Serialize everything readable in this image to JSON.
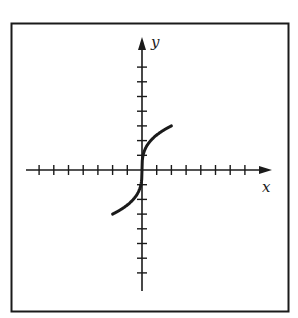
{
  "chart_data": {
    "type": "line",
    "title": "",
    "xlabel": "x",
    "ylabel": "y",
    "xlim": [
      -8,
      8
    ],
    "ylim": [
      -8,
      8
    ],
    "grid": false,
    "ticks": {
      "x": [
        -7,
        -6,
        -5,
        -4,
        -3,
        -2,
        -1,
        1,
        2,
        3,
        4,
        5,
        6,
        7
      ],
      "y": [
        -7,
        -6,
        -5,
        -4,
        -3,
        -2,
        -1,
        1,
        2,
        3,
        4,
        5,
        6,
        7
      ]
    },
    "tick_labels_shown": false,
    "series": [
      {
        "name": "curve",
        "description": "cube-root shaped curve through origin, vertical tangent at origin",
        "x": [
          -2,
          -1.5,
          -1,
          -0.5,
          -0.2,
          -0.05,
          0,
          0.05,
          0.2,
          0.5,
          1,
          1.5,
          2
        ],
        "y": [
          -3,
          -2.73,
          -2.38,
          -1.89,
          -1.39,
          -0.88,
          0,
          0.88,
          1.39,
          1.89,
          2.38,
          2.73,
          3
        ]
      }
    ]
  },
  "axes": {
    "x_label": "x",
    "y_label": "y"
  },
  "colors": {
    "ink": "#1a1a1a",
    "background": "#ffffff"
  }
}
